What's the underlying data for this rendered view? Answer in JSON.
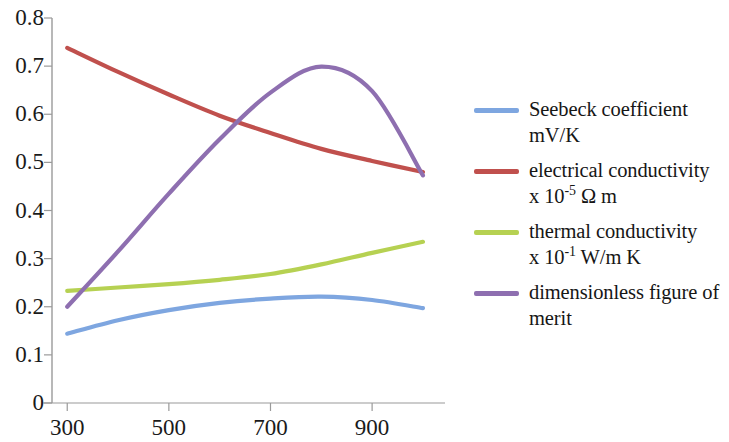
{
  "chart_data": {
    "type": "line",
    "title": "",
    "xlabel": "",
    "ylabel": "",
    "xlim": [
      270,
      1010
    ],
    "ylim": [
      0,
      0.8
    ],
    "grid": false,
    "legend_position": "right",
    "x_ticks": [
      "300",
      "500",
      "700",
      "900"
    ],
    "x_tick_values": [
      300,
      500,
      700,
      900
    ],
    "y_ticks": [
      "0",
      "0.1",
      "0.2",
      "0.3",
      "0.4",
      "0.5",
      "0.6",
      "0.7",
      "0.8"
    ],
    "y_tick_values": [
      0,
      0.1,
      0.2,
      0.3,
      0.4,
      0.5,
      0.6,
      0.7,
      0.8
    ],
    "x": [
      300,
      400,
      500,
      600,
      700,
      800,
      900,
      1000
    ],
    "series": [
      {
        "name": "Seebeck coefficient mV/K",
        "legend_line1": "Seebeck coefficient",
        "legend_line2": "mV/K",
        "color": "#7EA6E0",
        "values": [
          0.144,
          0.172,
          0.193,
          0.208,
          0.217,
          0.221,
          0.214,
          0.197
        ]
      },
      {
        "name": "electrical conductivity x 10^-5 Ohm m",
        "legend_line1": "electrical conductivity",
        "legend_line2_prefix": "x 10",
        "legend_line2_exp": "-5",
        "legend_line2_suffix": " Ω m",
        "color": "#C0504D",
        "values": [
          0.738,
          0.688,
          0.641,
          0.597,
          0.561,
          0.528,
          0.503,
          0.48
        ]
      },
      {
        "name": "thermal conductivity x 10^-1 W/m K",
        "legend_line1": "thermal conductivity",
        "legend_line2_prefix": "x 10",
        "legend_line2_exp": "-1",
        "legend_line2_suffix": " W/m K",
        "color": "#B6D152",
        "values": [
          0.233,
          0.24,
          0.247,
          0.256,
          0.268,
          0.288,
          0.312,
          0.335
        ]
      },
      {
        "name": "dimensionless figure of merit",
        "legend_line1": "dimensionless figure of",
        "legend_line2": "merit",
        "color": "#8E6FB0",
        "values": [
          0.2,
          0.315,
          0.435,
          0.548,
          0.645,
          0.699,
          0.648,
          0.473
        ]
      }
    ],
    "axis_color": "#9a9a9a"
  }
}
